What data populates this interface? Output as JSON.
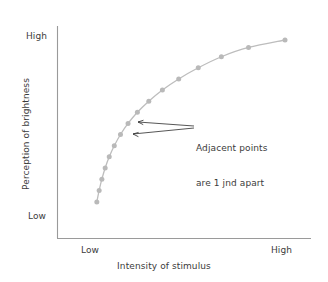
{
  "chart_data": {
    "type": "line",
    "title": "",
    "subtitle": "",
    "xlabel": "Intensity of stimulus",
    "ylabel": "Perception of brightness",
    "x_tick_labels": [
      "Low",
      "High"
    ],
    "y_tick_labels": [
      "Low",
      "High"
    ],
    "xlim": [
      "Low",
      "High"
    ],
    "ylim": [
      "Low",
      "High"
    ],
    "grid": false,
    "legend": "none",
    "series": [
      {
        "name": "Perceived brightness vs stimulus intensity",
        "marker": "circle",
        "color": "#b9b9b9",
        "line_color": "#bdbdbd",
        "description": "Logarithmic (Fechner) curve: equal just-noticeable-differences in perception correspond to geometrically increasing stimulus intensity",
        "points": [
          {
            "x": 0.03,
            "y": 0.09
          },
          {
            "x": 0.042,
            "y": 0.155
          },
          {
            "x": 0.056,
            "y": 0.218
          },
          {
            "x": 0.073,
            "y": 0.281
          },
          {
            "x": 0.094,
            "y": 0.344
          },
          {
            "x": 0.12,
            "y": 0.406
          },
          {
            "x": 0.152,
            "y": 0.469
          },
          {
            "x": 0.191,
            "y": 0.531
          },
          {
            "x": 0.239,
            "y": 0.594
          },
          {
            "x": 0.298,
            "y": 0.656
          },
          {
            "x": 0.368,
            "y": 0.719
          },
          {
            "x": 0.452,
            "y": 0.781
          },
          {
            "x": 0.553,
            "y": 0.844
          },
          {
            "x": 0.672,
            "y": 0.906
          },
          {
            "x": 0.812,
            "y": 0.958
          },
          {
            "x": 1.0,
            "y": 1.0
          }
        ]
      }
    ],
    "annotations": [
      {
        "id": "jnd-note",
        "text_lines": [
          "Adjacent points",
          "are 1 jnd apart"
        ],
        "points_to": [
          {
            "x": 0.152,
            "y": 0.469
          },
          {
            "x": 0.191,
            "y": 0.531
          }
        ]
      }
    ],
    "colors": {
      "axis": "#9a9a9a",
      "series": "#bdbdbd",
      "marker": "#b9b9b9",
      "text": "#3b3b3b",
      "leader": "#2b2b2b",
      "background": "#ffffff"
    }
  },
  "axes": {
    "y": {
      "title": "Perception of brightness",
      "tick_high": "High",
      "tick_low": "Low"
    },
    "x": {
      "title": "Intensity of stimulus",
      "tick_low": "Low",
      "tick_high": "High"
    }
  },
  "annotation": {
    "line1": "Adjacent points",
    "line2": "are 1 jnd apart"
  }
}
